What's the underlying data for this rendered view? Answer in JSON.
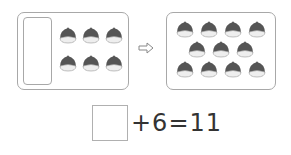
{
  "left_group": {
    "count": 6,
    "rows": [
      3,
      3
    ],
    "has_blank_slot": true
  },
  "arrow_icon": "right-arrow-outline",
  "right_group": {
    "count": 11,
    "rows": [
      4,
      3,
      4
    ]
  },
  "equation": {
    "blank": "",
    "text": "+6=11",
    "operator": "+",
    "addend": "6",
    "equals": "=",
    "result": "11"
  },
  "colors": {
    "nut_top": "#555555",
    "nut_bottom": "#eeeeee",
    "border": "#a8a8a8"
  }
}
